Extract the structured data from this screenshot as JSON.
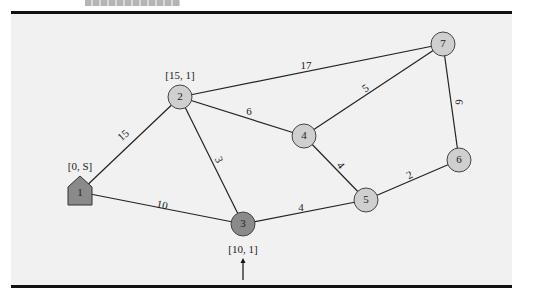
{
  "diagram": {
    "type": "weighted-undirected-graph",
    "colors": {
      "background": "#f1f1f1",
      "node_default": "#cfcfcf",
      "node_highlight": "#8a8a8a",
      "source_node": "#8a8a8a",
      "edge": "#222222",
      "rule": "#111111"
    },
    "nodes": [
      {
        "id": "1",
        "label": "1",
        "shape": "house",
        "x": 80,
        "y": 192,
        "tag": "[0, S]",
        "tag_x": 80,
        "tag_y": 167,
        "fill": "#8a8a8a"
      },
      {
        "id": "2",
        "label": "2",
        "shape": "circle",
        "x": 180,
        "y": 97,
        "tag": "[15, 1]",
        "tag_x": 180,
        "tag_y": 76,
        "fill": "#cfcfcf"
      },
      {
        "id": "3",
        "label": "3",
        "shape": "circle",
        "x": 243,
        "y": 224,
        "tag": "[10, 1]",
        "tag_x": 243,
        "tag_y": 250,
        "fill": "#8a8a8a"
      },
      {
        "id": "4",
        "label": "4",
        "shape": "circle",
        "x": 304,
        "y": 136,
        "tag": "",
        "fill": "#cfcfcf"
      },
      {
        "id": "5",
        "label": "5",
        "shape": "circle",
        "x": 366,
        "y": 200,
        "tag": "",
        "fill": "#cfcfcf"
      },
      {
        "id": "6",
        "label": "6",
        "shape": "circle",
        "x": 459,
        "y": 160,
        "tag": "",
        "fill": "#cfcfcf"
      },
      {
        "id": "7",
        "label": "7",
        "shape": "circle",
        "x": 443,
        "y": 44,
        "tag": "",
        "fill": "#cfcfcf"
      }
    ],
    "edges": [
      {
        "from": "1",
        "to": "2",
        "weight": "15",
        "lx": 124,
        "ly": 136,
        "rot": -42
      },
      {
        "from": "1",
        "to": "3",
        "weight": "10",
        "lx": 162,
        "ly": 206,
        "rot": 12
      },
      {
        "from": "2",
        "to": "3",
        "weight": "3",
        "lx": 218,
        "ly": 160,
        "rot": 64
      },
      {
        "from": "2",
        "to": "4",
        "weight": "6",
        "lx": 249,
        "ly": 112,
        "rot": 0
      },
      {
        "from": "2",
        "to": "7",
        "weight": "17",
        "lx": 306,
        "ly": 66,
        "rot": 0
      },
      {
        "from": "4",
        "to": "7",
        "weight": "5",
        "lx": 366,
        "ly": 89,
        "rot": -35
      },
      {
        "from": "4",
        "to": "5",
        "weight": "4",
        "lx": 340,
        "ly": 166,
        "rot": 50
      },
      {
        "from": "3",
        "to": "5",
        "weight": "4",
        "lx": 301,
        "ly": 208,
        "rot": 0
      },
      {
        "from": "5",
        "to": "6",
        "weight": "2",
        "lx": 410,
        "ly": 176,
        "rot": -28
      },
      {
        "from": "7",
        "to": "6",
        "weight": "6",
        "lx": 458,
        "ly": 102,
        "rot": 95
      }
    ],
    "arrow": {
      "x": 243,
      "y_from": 280,
      "y_to": 258,
      "target": "3"
    }
  }
}
